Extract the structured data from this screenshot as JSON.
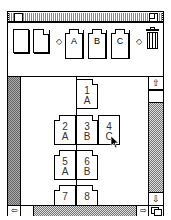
{
  "window": {
    "title": "",
    "close_box": "close-box",
    "zoom_box": "zoom-box"
  },
  "toolbar": {
    "items": [
      {
        "type": "blank-page",
        "label": ""
      },
      {
        "type": "dog-ear-page",
        "label": ""
      },
      {
        "type": "arrow-left",
        "glyph": "◇"
      },
      {
        "type": "card",
        "label": "A"
      },
      {
        "type": "card",
        "label": "B"
      },
      {
        "type": "card",
        "label": "C"
      },
      {
        "type": "arrow-right",
        "glyph": "◇"
      },
      {
        "type": "trash",
        "label": ""
      }
    ]
  },
  "canvas": {
    "cards": [
      {
        "num": "1",
        "letter": "A"
      },
      {
        "num": "2",
        "letter": "A"
      },
      {
        "num": "3",
        "letter": "B"
      },
      {
        "num": "4",
        "letter": "C"
      },
      {
        "num": "5",
        "letter": "A"
      },
      {
        "num": "6",
        "letter": "B"
      },
      {
        "num": "7",
        "letter": ""
      },
      {
        "num": "8",
        "letter": ""
      }
    ]
  },
  "scrollbars": {
    "up_glyph": "⇧",
    "down_glyph": "⇩",
    "left_glyph": "⇦",
    "right_glyph": "⇨"
  }
}
